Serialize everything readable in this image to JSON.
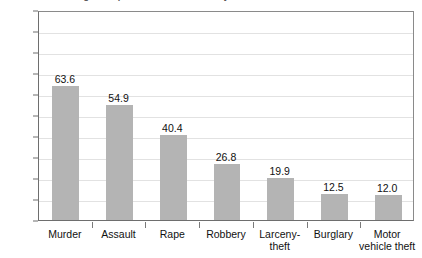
{
  "chart_data": {
    "type": "bar",
    "title": "Percentage of reported crimes cleared by arrest",
    "xlabel": "",
    "ylabel": "",
    "categories": [
      "Murder",
      "Assault",
      "Rape",
      "Robbery",
      "Larceny-\ntheft",
      "Burglary",
      "Motor\nvehicle theft"
    ],
    "values": [
      63.6,
      54.9,
      40.4,
      26.8,
      19.9,
      12.5,
      12.0
    ],
    "value_labels": [
      "63.6",
      "54.9",
      "40.4",
      "26.8",
      "19.9",
      "12.5",
      "12.0"
    ],
    "ylim": [
      0,
      100
    ],
    "yticks": [
      0,
      10,
      20,
      30,
      40,
      50,
      60,
      70,
      80,
      90,
      100
    ],
    "ytick_labels": [
      "0",
      "10",
      "20",
      "30",
      "40",
      "50",
      "60",
      "70",
      "80",
      "90",
      "100"
    ],
    "grid": true,
    "legend": null,
    "bar_color": "#b4b4b4",
    "grid_color": "#e2e2e2",
    "axis_color": "#6e6e6e"
  }
}
